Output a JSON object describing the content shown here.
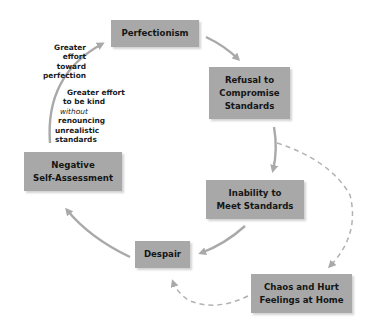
{
  "diagram": {
    "type": "cycle",
    "colors": {
      "box_fill": "#a8a8a8",
      "box_text": "#151515",
      "arrow": "#a9a9a9",
      "background": "#ffffff"
    },
    "nodes": {
      "perfectionism": {
        "lines": [
          "Perfectionism"
        ]
      },
      "refusal": {
        "lines": [
          "Refusal to",
          "Compromise",
          "Standards"
        ]
      },
      "inability": {
        "lines": [
          "Inability to",
          "Meet Standards"
        ]
      },
      "despair": {
        "lines": [
          "Despair"
        ]
      },
      "chaos": {
        "lines": [
          "Chaos and Hurt",
          "Feelings at Home"
        ]
      },
      "negative": {
        "lines": [
          "Negative",
          "Self-Assessment"
        ]
      }
    },
    "annotations": {
      "effort_perfection": {
        "lines": [
          "Greater",
          "effort",
          "toward",
          "perfection"
        ]
      },
      "effort_kind": {
        "lines": [
          "Greater effort",
          "to be kind",
          "without",
          "renouncing",
          "unrealistic",
          "standards"
        ],
        "italic_line": "without"
      }
    },
    "edges": [
      {
        "from": "Perfectionism",
        "to": "Refusal to Compromise Standards",
        "style": "solid"
      },
      {
        "from": "Refusal to Compromise Standards",
        "to": "Inability to Meet Standards",
        "style": "solid"
      },
      {
        "from": "Refusal to Compromise Standards",
        "to": "Chaos and Hurt Feelings at Home",
        "style": "dashed"
      },
      {
        "from": "Inability to Meet Standards",
        "to": "Despair",
        "style": "solid"
      },
      {
        "from": "Chaos and Hurt Feelings at Home",
        "to": "Despair",
        "style": "dashed"
      },
      {
        "from": "Despair",
        "to": "Negative Self-Assessment",
        "style": "solid"
      },
      {
        "from": "Negative Self-Assessment",
        "to": "Perfectionism",
        "style": "solid"
      }
    ]
  }
}
